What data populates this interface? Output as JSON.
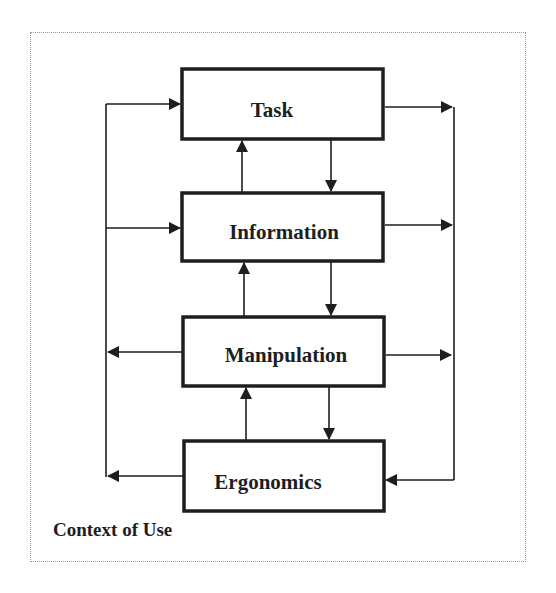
{
  "diagram": {
    "frame_label": "Context of Use",
    "boxes": [
      {
        "id": "task",
        "label": "Task"
      },
      {
        "id": "information",
        "label": "Information"
      },
      {
        "id": "manipulation",
        "label": "Manipulation"
      },
      {
        "id": "ergonomics",
        "label": "Ergonomics"
      }
    ],
    "edges": [
      {
        "from": "information",
        "to": "task",
        "direction": "up"
      },
      {
        "from": "task",
        "to": "information",
        "direction": "down"
      },
      {
        "from": "manipulation",
        "to": "information",
        "direction": "up"
      },
      {
        "from": "information",
        "to": "manipulation",
        "direction": "down"
      },
      {
        "from": "ergonomics",
        "to": "manipulation",
        "direction": "up"
      },
      {
        "from": "manipulation",
        "to": "ergonomics",
        "direction": "down"
      },
      {
        "from": "left-feedback-line",
        "to": "task",
        "direction": "right"
      },
      {
        "from": "left-feedback-line",
        "to": "information",
        "direction": "right"
      },
      {
        "from": "manipulation",
        "to": "left-feedback-line",
        "direction": "left"
      },
      {
        "from": "ergonomics",
        "to": "left-feedback-line",
        "direction": "left"
      },
      {
        "from": "task",
        "to": "right-feedback-line",
        "direction": "right"
      },
      {
        "from": "information",
        "to": "right-feedback-line",
        "direction": "right"
      },
      {
        "from": "manipulation",
        "to": "right-feedback-line",
        "direction": "right"
      },
      {
        "from": "right-feedback-line",
        "to": "ergonomics",
        "direction": "left"
      }
    ],
    "colors": {
      "stroke": "#1e1e1e",
      "frame_border": "#9a9a9a",
      "background": "#ffffff"
    }
  }
}
